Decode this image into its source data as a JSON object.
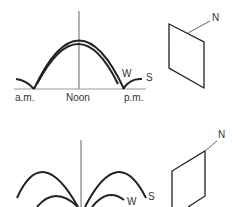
{
  "top_diagram": {
    "curve_labels": {
      "winter": "W",
      "summer": "S"
    },
    "axis_labels": {
      "morning": "a.m.",
      "noon": "Noon",
      "afternoon": "p.m."
    },
    "panel": {
      "normal_label": "N"
    }
  },
  "bottom_diagram": {
    "curve_labels": {
      "winter": "W",
      "summer": "S"
    },
    "panel": {
      "normal_label": "N"
    }
  },
  "colors": {
    "line": "#222222",
    "axis": "#666666",
    "text": "#333333"
  }
}
